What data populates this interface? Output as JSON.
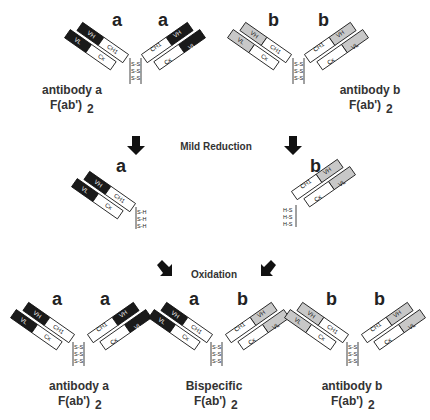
{
  "colors": {
    "variable_a": "#1a1a1a",
    "variable_b": "#c8c8c8",
    "constant": "#ffffff",
    "stroke": "#111111",
    "text": "#333333"
  },
  "domains": {
    "vh": "VH",
    "vl": "VL",
    "ch1": "CH1",
    "ck": "Cκ"
  },
  "disulfide": "S-S",
  "thiol_right": "S-H",
  "thiol_left": "H-S",
  "top": {
    "a": {
      "letter_left": "a",
      "letter_right": "a",
      "label_line1": "antibody a",
      "label_line2": "F(ab')",
      "label_sub": "2"
    },
    "b": {
      "letter_left": "b",
      "letter_right": "b",
      "label_line1": "antibody b",
      "label_line2": "F(ab')",
      "label_sub": "2"
    }
  },
  "steps": {
    "reduction": "Mild Reduction",
    "oxidation": "Oxidation"
  },
  "middle": {
    "a_letter": "a",
    "b_letter": "b"
  },
  "bottom": {
    "a": {
      "letter_left": "a",
      "letter_right": "a",
      "label_line1": "antibody a",
      "label_line2": "F(ab')",
      "label_sub": "2"
    },
    "bis": {
      "letter_left": "a",
      "letter_right": "b",
      "label_line1": "Bispecific",
      "label_line2": "F(ab')",
      "label_sub": "2"
    },
    "b": {
      "letter_left": "b",
      "letter_right": "b",
      "label_line1": "antibody b",
      "label_line2": "F(ab')",
      "label_sub": "2"
    }
  }
}
